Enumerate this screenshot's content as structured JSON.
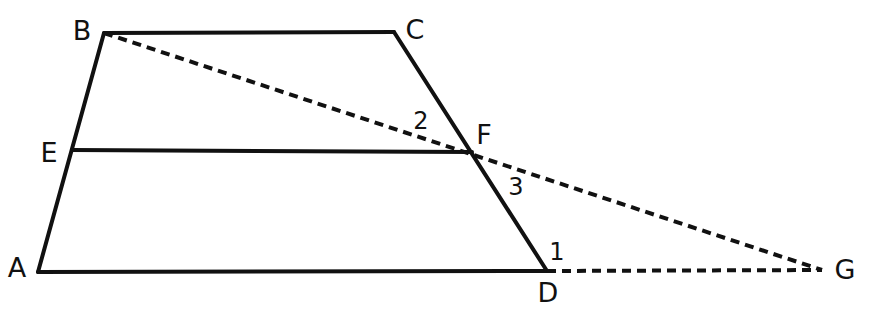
{
  "diagram": {
    "type": "geometry-figure",
    "canvas": {
      "width": 878,
      "height": 317,
      "background": "#ffffff"
    },
    "style": {
      "solid_stroke_color": "#111111",
      "solid_stroke_width": 4,
      "dashed_stroke_color": "#111111",
      "dashed_stroke_width": 4,
      "dash_pattern": "9 6"
    },
    "points": [
      {
        "id": "A",
        "label": "A",
        "x": 38,
        "y": 272,
        "label_x": 17,
        "label_y": 267
      },
      {
        "id": "B",
        "label": "B",
        "x": 104,
        "y": 33,
        "label_x": 82,
        "label_y": 30
      },
      {
        "id": "C",
        "label": "C",
        "x": 394,
        "y": 32,
        "label_x": 415,
        "label_y": 29
      },
      {
        "id": "D",
        "label": "D",
        "x": 547,
        "y": 271,
        "label_x": 548,
        "label_y": 292
      },
      {
        "id": "E",
        "label": "E",
        "x": 72,
        "y": 150,
        "label_x": 49,
        "label_y": 152
      },
      {
        "id": "F",
        "label": "F",
        "x": 472,
        "y": 152,
        "label_x": 484,
        "label_y": 134
      },
      {
        "id": "G",
        "label": "G",
        "x": 822,
        "y": 270,
        "label_x": 845,
        "label_y": 269
      }
    ],
    "segments": [
      {
        "id": "AB",
        "from": "A",
        "to": "B",
        "style": "solid"
      },
      {
        "id": "BC",
        "from": "B",
        "to": "C",
        "style": "solid"
      },
      {
        "id": "CD",
        "from": "C",
        "to": "D",
        "style": "solid"
      },
      {
        "id": "AD",
        "from": "A",
        "to": "D",
        "style": "solid"
      },
      {
        "id": "EF",
        "from": "E",
        "to": "F",
        "style": "solid"
      },
      {
        "id": "BG",
        "from": "B",
        "to": "G",
        "style": "dashed"
      },
      {
        "id": "DG",
        "from": "D",
        "to": "G",
        "style": "dashed"
      }
    ],
    "angle_labels": [
      {
        "id": "angle-1",
        "label": "1",
        "x": 557,
        "y": 252
      },
      {
        "id": "angle-2",
        "label": "2",
        "x": 421,
        "y": 121
      },
      {
        "id": "angle-3",
        "label": "3",
        "x": 516,
        "y": 187
      }
    ]
  }
}
